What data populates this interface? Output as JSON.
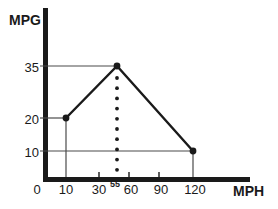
{
  "page": {
    "background": "#ffffff"
  },
  "chart_data": {
    "type": "line",
    "title": "",
    "xlabel": "MPH",
    "ylabel": "MPG",
    "x": [
      10,
      55,
      120
    ],
    "y": [
      20,
      35,
      10
    ],
    "series": [
      {
        "name": "fuel-economy-vs-speed",
        "points": [
          {
            "mph": 10,
            "mpg": 20
          },
          {
            "mph": 55,
            "mpg": 35
          },
          {
            "mph": 120,
            "mpg": 10
          }
        ]
      }
    ],
    "x_tick_labels": [
      "0",
      "10",
      "30",
      "55",
      "60",
      "90",
      "120"
    ],
    "y_tick_labels": [
      "35",
      "20",
      "10"
    ],
    "xlim": [
      0,
      130
    ],
    "ylim": [
      0,
      40
    ],
    "grid": false,
    "legend": false,
    "marker": "filled-circle",
    "guides": {
      "dotted_vertical_at_x": 55,
      "horizontal_at_y": [
        35,
        20,
        10
      ],
      "vertical_at_x": [
        10,
        120
      ]
    },
    "colors": {
      "axis": "#1a1a1a",
      "line": "#1a1a1a",
      "guide": "#4a4a4a",
      "text": "#1a1a1a",
      "background": "#ffffff"
    }
  }
}
